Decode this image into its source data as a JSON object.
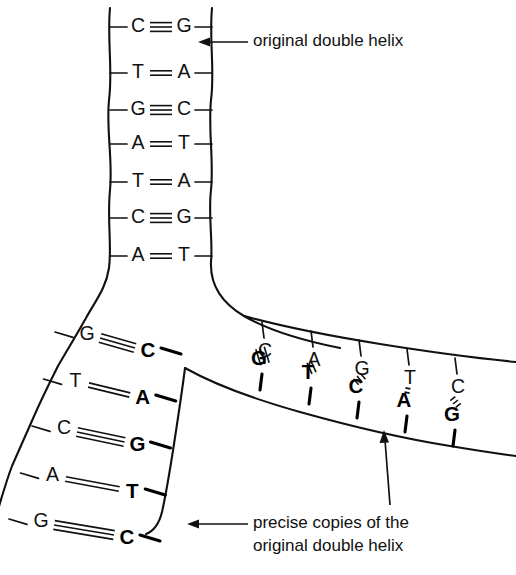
{
  "figure": {
    "ink_color": "#111111",
    "background_color": "#ffffff"
  },
  "annotations": {
    "top": {
      "text": "original double helix",
      "arrow": "left-arrow",
      "x": 253,
      "y": 42
    },
    "bottom_left": {
      "line1": "precise copies of the",
      "line2": "original double helix",
      "arrow": "left-arrow",
      "x": 253,
      "y": 524
    }
  },
  "parent_helix": {
    "name": "original double helix",
    "left_backbone_x": 110,
    "right_backbone_x": 212,
    "pairs": [
      {
        "left": "C",
        "bond": "triple",
        "right": "G",
        "y": 27
      },
      {
        "left": "T",
        "bond": "double",
        "right": "A",
        "y": 73
      },
      {
        "left": "G",
        "bond": "triple",
        "right": "C",
        "y": 110
      },
      {
        "left": "A",
        "bond": "double",
        "right": "T",
        "y": 144
      },
      {
        "left": "T",
        "bond": "double",
        "right": "A",
        "y": 182
      },
      {
        "left": "C",
        "bond": "triple",
        "right": "G",
        "y": 218
      },
      {
        "left": "A",
        "bond": "double",
        "right": "T",
        "y": 256
      }
    ]
  },
  "daughter_left": {
    "name": "left daughter duplex",
    "orientation": "diagonal-down-left",
    "pairs": [
      {
        "old": "G",
        "bond": "triple",
        "new": "C",
        "y": 342
      },
      {
        "old": "T",
        "bond": "double",
        "new": "A",
        "y": 389
      },
      {
        "old": "C",
        "bond": "triple",
        "new": "G",
        "y": 436
      },
      {
        "old": "A",
        "bond": "double",
        "new": "T",
        "y": 483
      },
      {
        "old": "G",
        "bond": "triple",
        "new": "C",
        "y": 529
      }
    ]
  },
  "daughter_right": {
    "name": "right daughter duplex",
    "orientation": "horizontal-slope-down-right",
    "pairs": [
      {
        "old": "C",
        "bond": "triple",
        "new": "G",
        "x": 262
      },
      {
        "old": "A",
        "bond": "double",
        "new": "T",
        "x": 311
      },
      {
        "old": "G",
        "bond": "triple",
        "new": "C",
        "x": 359
      },
      {
        "old": "T",
        "bond": "double",
        "new": "A",
        "x": 407
      },
      {
        "old": "C",
        "bond": "triple",
        "new": "G",
        "x": 455
      }
    ]
  },
  "legend": {
    "old_strand_style": "thin regular type",
    "new_strand_style": "bold type"
  }
}
